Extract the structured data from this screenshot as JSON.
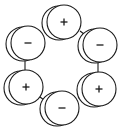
{
  "diagram": {
    "title": "",
    "colors": {
      "stroke": "#1a1a1a",
      "fill": "#ffffff",
      "background": "#ffffff"
    },
    "nodes": [
      {
        "id": "top",
        "charge": "+",
        "cx": 64,
        "cy": 22,
        "r": 17,
        "back_dx": -5,
        "back_dy": 1
      },
      {
        "id": "upper-left",
        "charge": "−",
        "cx": 28,
        "cy": 43,
        "r": 17,
        "back_dx": -5,
        "back_dy": 1
      },
      {
        "id": "upper-right",
        "charge": "−",
        "cx": 100,
        "cy": 45,
        "r": 17,
        "back_dx": -5,
        "back_dy": 1
      },
      {
        "id": "lower-left",
        "charge": "+",
        "cx": 26,
        "cy": 87,
        "r": 17,
        "back_dx": -5,
        "back_dy": 1
      },
      {
        "id": "lower-right",
        "charge": "+",
        "cx": 99,
        "cy": 89,
        "r": 17,
        "back_dx": -5,
        "back_dy": 1
      },
      {
        "id": "bottom",
        "charge": "−",
        "cx": 62,
        "cy": 108,
        "r": 17,
        "back_dx": -5,
        "back_dy": 1
      }
    ],
    "bonds": [
      {
        "from": "upper-left",
        "to": "lower-left",
        "x1": 25,
        "y1": 59,
        "x2": 25,
        "y2": 70
      },
      {
        "from": "upper-right",
        "to": "lower-right",
        "x1": 98,
        "y1": 61,
        "x2": 98,
        "y2": 73
      },
      {
        "from": "top",
        "to": "upper-left",
        "x1": 44,
        "y1": 30,
        "x2": 47,
        "y2": 34
      },
      {
        "from": "top",
        "to": "upper-right",
        "x1": 80,
        "y1": 31,
        "x2": 84,
        "y2": 34
      },
      {
        "from": "lower-left",
        "to": "bottom",
        "x1": 40,
        "y1": 97,
        "x2": 44,
        "y2": 100
      },
      {
        "from": "lower-right",
        "to": "bottom",
        "x1": 78,
        "y1": 98,
        "x2": 83,
        "y2": 96
      }
    ]
  }
}
